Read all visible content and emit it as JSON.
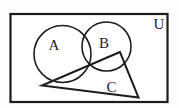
{
  "diagram": {
    "type": "venn-euler-set-diagram",
    "background_color": "#fdfdfd",
    "stroke_color": "#1c1c1c",
    "universal_set": {
      "label": "U",
      "shape": "rectangle"
    },
    "sets": [
      {
        "label": "A",
        "shape": "circle"
      },
      {
        "label": "B",
        "shape": "circle"
      },
      {
        "label": "C",
        "shape": "triangle"
      }
    ]
  }
}
